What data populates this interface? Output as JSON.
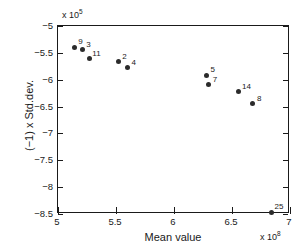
{
  "chart_data": {
    "type": "scatter",
    "title": "",
    "xlabel": "Mean value",
    "ylabel": "(−1) x Std.dev.",
    "x_exponent_text": "x 10",
    "x_exponent_power": "8",
    "y_exponent_text": "x 10",
    "y_exponent_power": "5",
    "xlim": [
      5,
      7
    ],
    "ylim": [
      -8.5,
      -5
    ],
    "grid": false,
    "legend": "none",
    "xticks": [
      "5",
      "5.5",
      "6",
      "6.5",
      "7"
    ],
    "xtick_values": [
      5,
      5.5,
      6,
      6.5,
      7
    ],
    "yticks": [
      "−5",
      "−5.5",
      "−6",
      "−6.5",
      "−7",
      "−7.5",
      "−8",
      "−8.5"
    ],
    "ytick_values": [
      -5,
      -5.5,
      -6,
      -6.5,
      -7,
      -7.5,
      -8,
      -8.5
    ],
    "points": [
      {
        "label": "9",
        "x": 5.14,
        "y": -5.4,
        "label_dx": 4,
        "label_dy": -9
      },
      {
        "label": "3",
        "x": 5.21,
        "y": -5.44,
        "label_dx": 4,
        "label_dy": -9
      },
      {
        "label": "11",
        "x": 5.27,
        "y": -5.6,
        "label_dx": 3,
        "label_dy": -8
      },
      {
        "label": "2",
        "x": 5.52,
        "y": -5.67,
        "label_dx": 4,
        "label_dy": -9
      },
      {
        "label": "4",
        "x": 5.6,
        "y": -5.77,
        "label_dx": 4,
        "label_dy": -8
      },
      {
        "label": "5",
        "x": 6.28,
        "y": -5.92,
        "label_dx": 4,
        "label_dy": -9
      },
      {
        "label": "7",
        "x": 6.3,
        "y": -6.08,
        "label_dx": 4,
        "label_dy": -8
      },
      {
        "label": "14",
        "x": 6.56,
        "y": -6.22,
        "label_dx": 3,
        "label_dy": -9
      },
      {
        "label": "8",
        "x": 6.68,
        "y": -6.45,
        "label_dx": 4,
        "label_dy": -9
      },
      {
        "label": "25",
        "x": 6.84,
        "y": -8.47,
        "label_dx": 3,
        "label_dy": -9
      }
    ]
  }
}
